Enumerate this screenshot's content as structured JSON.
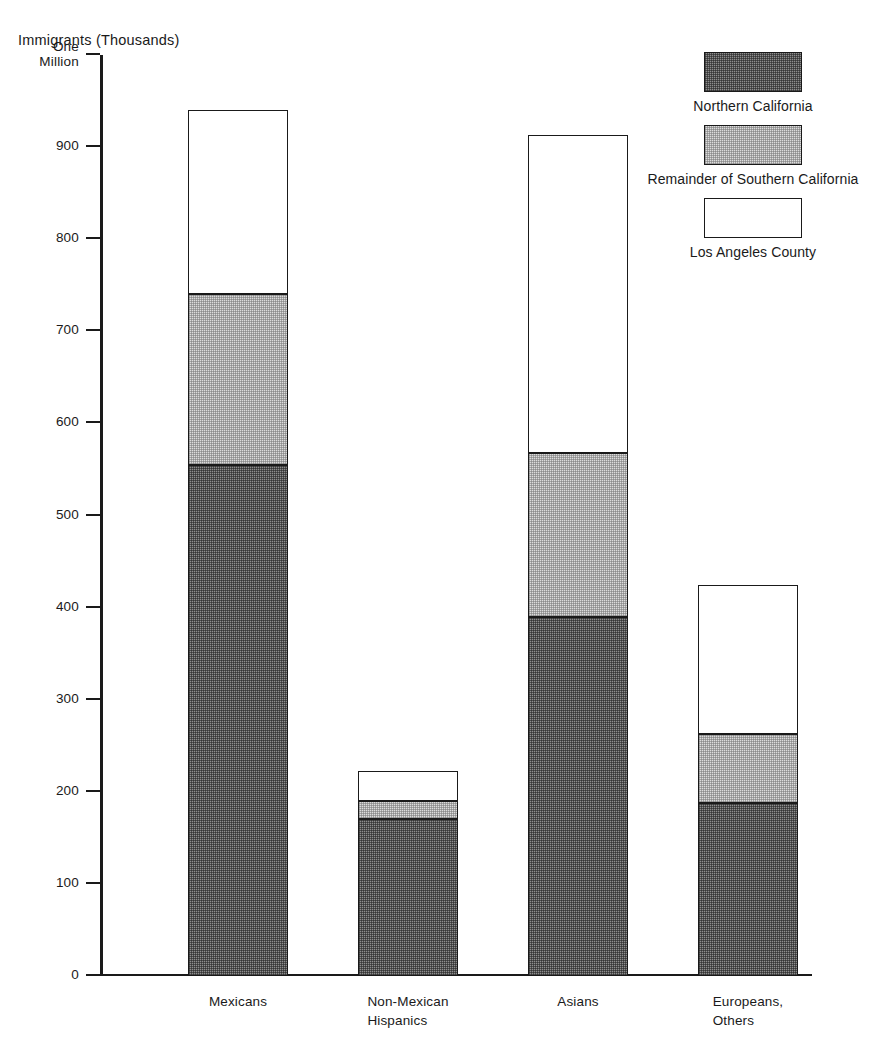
{
  "chart_data": {
    "type": "bar",
    "subtype": "stacked-bar",
    "title": "",
    "ylabel": "Immigrants (Thousands)",
    "xlabel": "",
    "ylim": [
      0,
      1000
    ],
    "grid": false,
    "legend_position": "top-right",
    "ytick_values": [
      0,
      100,
      200,
      300,
      400,
      500,
      600,
      700,
      800,
      900,
      1000
    ],
    "ytick_labels": [
      "0",
      "100",
      "200",
      "300",
      "400",
      "500",
      "600",
      "700",
      "800",
      "900",
      "One\nMillion"
    ],
    "categories": [
      "Mexicans",
      "Non-Mexican\nHispanics",
      "Asians",
      "Europeans,\nOthers"
    ],
    "series": [
      {
        "name": "Northern California",
        "color": "#8e8e8e",
        "values": [
          555,
          170,
          390,
          188
        ]
      },
      {
        "name": "Remainder of Southern California",
        "color": "#dcdcdc",
        "values": [
          185,
          20,
          178,
          75
        ]
      },
      {
        "name": "Los Angeles County",
        "color": "#ffffff",
        "values": [
          200,
          33,
          345,
          162
        ]
      }
    ],
    "totals": [
      940,
      223,
      913,
      425
    ],
    "cumulative_tops": [
      {
        "northern": 555,
        "remainder": 740,
        "los_angeles": 940
      },
      {
        "northern": 170,
        "remainder": 190,
        "los_angeles": 223
      },
      {
        "northern": 390,
        "remainder": 568,
        "los_angeles": 913
      },
      {
        "northern": 188,
        "remainder": 263,
        "los_angeles": 425
      }
    ]
  },
  "axis": {
    "y_title": "Immigrants (Thousands)",
    "ticks": [
      {
        "value": 1000,
        "label": "One\nMillion",
        "two_line": true
      },
      {
        "value": 900,
        "label": "900",
        "two_line": false
      },
      {
        "value": 800,
        "label": "800",
        "two_line": false
      },
      {
        "value": 700,
        "label": "700",
        "two_line": false
      },
      {
        "value": 600,
        "label": "600",
        "two_line": false
      },
      {
        "value": 500,
        "label": "500",
        "two_line": false
      },
      {
        "value": 400,
        "label": "400",
        "two_line": false
      },
      {
        "value": 300,
        "label": "300",
        "two_line": false
      },
      {
        "value": 200,
        "label": "200",
        "two_line": false
      },
      {
        "value": 100,
        "label": "100",
        "two_line": false
      },
      {
        "value": 0,
        "label": "0",
        "two_line": false
      }
    ]
  },
  "legend": {
    "entries": [
      {
        "key": "northern",
        "label": "Northern California"
      },
      {
        "key": "remainder",
        "label": "Remainder of Southern California"
      },
      {
        "key": "la",
        "label": "Los Angeles County"
      }
    ]
  },
  "bars": [
    {
      "category": "Mexicans",
      "x": 88,
      "segments": [
        {
          "key": "northern",
          "series": "Northern California",
          "value": 555,
          "base": 0,
          "top": 555
        },
        {
          "key": "remainder",
          "series": "Remainder of Southern California",
          "value": 185,
          "base": 555,
          "top": 740
        },
        {
          "key": "la",
          "series": "Los Angeles County",
          "value": 200,
          "base": 740,
          "top": 940
        }
      ]
    },
    {
      "category": "Non-Mexican\nHispanics",
      "x": 258,
      "segments": [
        {
          "key": "northern",
          "series": "Northern California",
          "value": 170,
          "base": 0,
          "top": 170
        },
        {
          "key": "remainder",
          "series": "Remainder of Southern California",
          "value": 20,
          "base": 170,
          "top": 190
        },
        {
          "key": "la",
          "series": "Los Angeles County",
          "value": 33,
          "base": 190,
          "top": 223
        }
      ]
    },
    {
      "category": "Asians",
      "x": 428,
      "segments": [
        {
          "key": "northern",
          "series": "Northern California",
          "value": 390,
          "base": 0,
          "top": 390
        },
        {
          "key": "remainder",
          "series": "Remainder of Southern California",
          "value": 178,
          "base": 390,
          "top": 568
        },
        {
          "key": "la",
          "series": "Los Angeles County",
          "value": 345,
          "base": 568,
          "top": 913
        }
      ]
    },
    {
      "category": "Europeans,\nOthers",
      "x": 598,
      "segments": [
        {
          "key": "northern",
          "series": "Northern California",
          "value": 188,
          "base": 0,
          "top": 188
        },
        {
          "key": "remainder",
          "series": "Remainder of Southern California",
          "value": 75,
          "base": 188,
          "top": 263
        },
        {
          "key": "la",
          "series": "Los Angeles County",
          "value": 162,
          "base": 263,
          "top": 425
        }
      ]
    }
  ]
}
